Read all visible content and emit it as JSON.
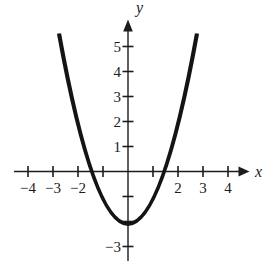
{
  "figure": {
    "background": "#ffffff",
    "curve_color": "#141414",
    "axis_color": "#1c1c1c",
    "text_color": "#1c1c1c"
  },
  "chart_data": {
    "type": "line",
    "title": "",
    "xlabel": "x",
    "ylabel": "y",
    "grid": false,
    "legend": null,
    "x_axis": {
      "ticks": [
        -4,
        -3,
        -2,
        -1,
        1,
        2,
        3,
        4
      ],
      "labels": [
        "−4",
        "−3",
        "−2",
        "",
        "",
        "2",
        "3",
        "4"
      ],
      "range_drawn": [
        -4.55,
        4.8
      ]
    },
    "y_axis": {
      "ticks": [
        1,
        2,
        3,
        4,
        5,
        -1,
        -2,
        -3
      ],
      "labels": [
        "1",
        "2",
        "3",
        "4",
        "5",
        "",
        "",
        "−3"
      ],
      "range_drawn": [
        -3.6,
        6.1
      ]
    },
    "series": [
      {
        "name": "parabola",
        "shape": "parabola",
        "vertex": [
          0,
          -2.1
        ],
        "x_intercepts": [
          -1.45,
          1.45
        ],
        "y_intercept": -2.1,
        "x_domain_drawn": [
          -2.76,
          2.76
        ],
        "points": [
          [
            -2.76,
            5.52
          ],
          [
            -2.5,
            4.15
          ],
          [
            -2.0,
            1.9
          ],
          [
            -1.45,
            0.0
          ],
          [
            -1.0,
            -1.1
          ],
          [
            -0.5,
            -1.85
          ],
          [
            0.0,
            -2.1
          ],
          [
            0.5,
            -1.85
          ],
          [
            1.0,
            -1.1
          ],
          [
            1.45,
            0.0
          ],
          [
            2.0,
            1.9
          ],
          [
            2.5,
            4.15
          ],
          [
            2.76,
            5.52
          ]
        ]
      }
    ]
  }
}
